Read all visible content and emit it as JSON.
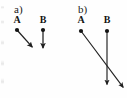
{
  "figure": {
    "width": 127,
    "height": 98,
    "background_color": "#fefefe",
    "stroke_color": "#1f1f1f",
    "text_color": "#141414"
  },
  "panels": [
    {
      "id": "a",
      "label": "a)",
      "label_x": 14,
      "label_y": 4,
      "points": [
        {
          "name": "A",
          "label": "A",
          "label_x": 17,
          "label_y": 15,
          "dot_x": 17,
          "dot_y": 30,
          "dot_radius": 2.1,
          "arrow": {
            "direction": "down-right",
            "tip_x": 34,
            "tip_y": 49,
            "length": 25
          }
        },
        {
          "name": "B",
          "label": "B",
          "label_x": 43,
          "label_y": 15,
          "dot_x": 43,
          "dot_y": 30,
          "dot_radius": 2.1,
          "arrow": {
            "direction": "down",
            "tip_x": 43,
            "tip_y": 50,
            "length": 20
          }
        }
      ]
    },
    {
      "id": "b",
      "label": "b)",
      "label_x": 78,
      "label_y": 4,
      "points": [
        {
          "name": "A",
          "label": "A",
          "label_x": 81,
          "label_y": 15,
          "dot_x": 81,
          "dot_y": 31,
          "dot_radius": 2.1,
          "arrow": {
            "direction": "down-right",
            "tip_x": 126,
            "tip_y": 90,
            "length": 74
          }
        },
        {
          "name": "B",
          "label": "B",
          "label_x": 107,
          "label_y": 15,
          "dot_x": 107,
          "dot_y": 31,
          "dot_radius": 2.1,
          "arrow": {
            "direction": "down",
            "tip_x": 107,
            "tip_y": 87,
            "length": 56
          }
        }
      ]
    }
  ]
}
